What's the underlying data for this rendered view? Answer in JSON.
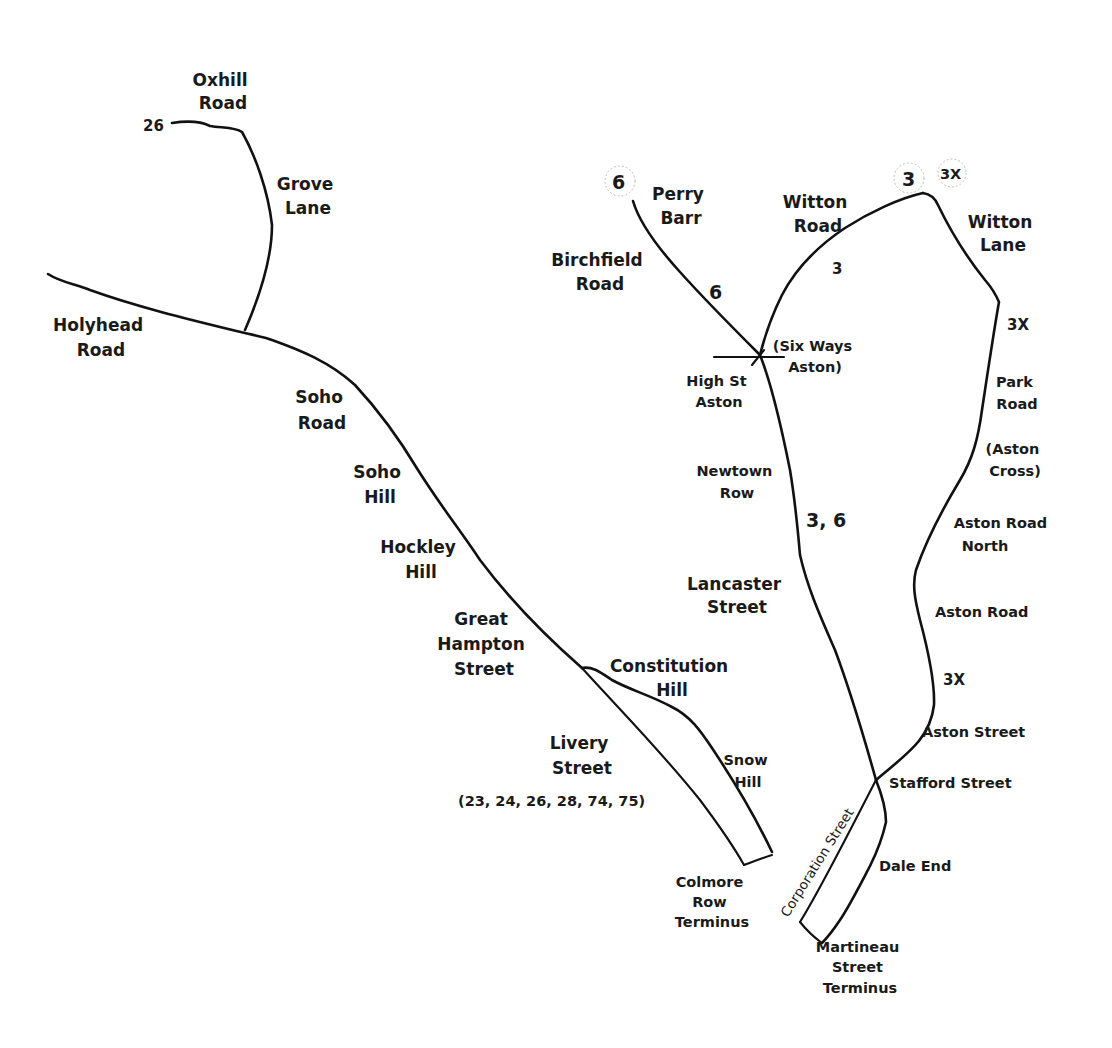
{
  "map": {
    "colors": {
      "background": "#ffffff",
      "line": "#111111",
      "text": "#1a1a1a",
      "badge_ring": "#bdbdbd"
    },
    "route_badges": {
      "r26": "26",
      "r6": "6",
      "r3": "3",
      "r3x": "3X"
    },
    "route_markers": {
      "birchfield_6": "6",
      "witton_road_3": "3",
      "witton_lane_3x": "3X",
      "newtown_3_6": "3, 6",
      "aston_road_3x": "3X"
    },
    "labels": {
      "oxhill_road": [
        "Oxhill",
        "Road"
      ],
      "grove_lane": [
        "Grove",
        "Lane"
      ],
      "holyhead_road": [
        "Holyhead",
        "Road"
      ],
      "soho_road": [
        "Soho",
        "Road"
      ],
      "soho_hill": [
        "Soho",
        "Hill"
      ],
      "hockley_hill": [
        "Hockley",
        "Hill"
      ],
      "great_hampton_street": [
        "Great",
        "Hampton",
        "Street"
      ],
      "constitution_hill": [
        "Constitution",
        "Hill"
      ],
      "livery_street": [
        "Livery",
        "Street"
      ],
      "livery_routes": "(23, 24, 26, 28, 74, 75)",
      "snow_hill": [
        "Snow",
        "Hill"
      ],
      "colmore_row_terminus": [
        "Colmore",
        "Row",
        "Terminus"
      ],
      "perry_barr": [
        "Perry",
        "Barr"
      ],
      "birchfield_road": [
        "Birchfield",
        "Road"
      ],
      "witton_road": [
        "Witton",
        "Road"
      ],
      "witton_lane": [
        "Witton",
        "Lane"
      ],
      "six_ways_aston": [
        "(Six Ways",
        "Aston)"
      ],
      "high_st_aston": [
        "High St",
        "Aston"
      ],
      "park_road": [
        "Park",
        "Road"
      ],
      "aston_cross": [
        "(Aston",
        "Cross)"
      ],
      "newtown_row": [
        "Newtown",
        "Row"
      ],
      "aston_road_north": [
        "Aston Road",
        "North"
      ],
      "lancaster_street": [
        "Lancaster",
        "Street"
      ],
      "aston_road": "Aston Road",
      "aston_street": "Aston Street",
      "stafford_street": "Stafford Street",
      "corporation_street": "Corporation Street",
      "dale_end": "Dale End",
      "martineau_street_terminus": [
        "Martineau",
        "Street",
        "Terminus"
      ]
    }
  }
}
